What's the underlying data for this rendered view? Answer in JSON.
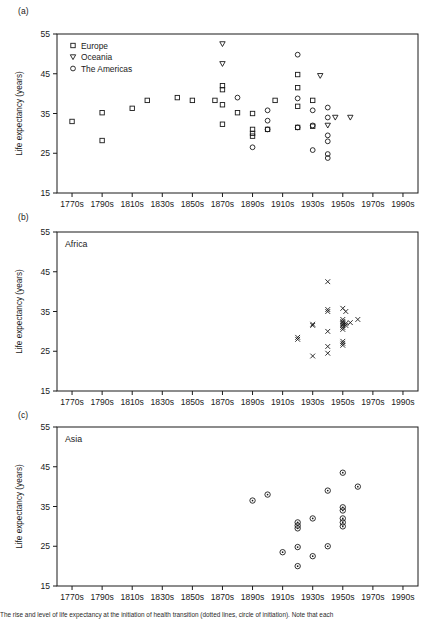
{
  "figure": {
    "caption": "The rise and level of life expectancy at the initiation of health transition (dotted lines, circle of initiation). Note that each",
    "y_axis_title": "Life expectancy (years)",
    "y_ticks": [
      15,
      25,
      35,
      45,
      55
    ],
    "x_ticks": [
      "1770s",
      "1790s",
      "1810s",
      "1830s",
      "1850s",
      "1870s",
      "1890s",
      "1910s",
      "1930s",
      "1950s",
      "1970s",
      "1990s"
    ]
  },
  "chart_data": [
    {
      "type": "scatter",
      "panel": "(a)",
      "title": "",
      "xlabel": "",
      "ylabel": "Life expectancy (years)",
      "xlim": [
        1760,
        2000
      ],
      "ylim": [
        15,
        55
      ],
      "x_tick_values": [
        1770,
        1790,
        1810,
        1830,
        1850,
        1870,
        1890,
        1910,
        1930,
        1950,
        1970,
        1990
      ],
      "x_tick_labels": [
        "1770s",
        "1790s",
        "1810s",
        "1830s",
        "1850s",
        "1870s",
        "1890s",
        "1910s",
        "1930s",
        "1950s",
        "1970s",
        "1990s"
      ],
      "y_tick_values": [
        15,
        25,
        35,
        45,
        55
      ],
      "grid": false,
      "legend_position": "top-left",
      "series": [
        {
          "name": "Europe",
          "marker": "square",
          "points": [
            [
              1770,
              33.0
            ],
            [
              1790,
              35.2
            ],
            [
              1790,
              28.2
            ],
            [
              1810,
              36.3
            ],
            [
              1820,
              38.3
            ],
            [
              1840,
              39.0
            ],
            [
              1850,
              38.3
            ],
            [
              1865,
              38.3
            ],
            [
              1870,
              42.0
            ],
            [
              1870,
              41.0
            ],
            [
              1870,
              37.2
            ],
            [
              1870,
              32.3
            ],
            [
              1880,
              35.2
            ],
            [
              1890,
              35.0
            ],
            [
              1890,
              31.0
            ],
            [
              1890,
              30.0
            ],
            [
              1890,
              29.3
            ],
            [
              1900,
              31.0
            ],
            [
              1905,
              38.3
            ],
            [
              1920,
              44.8
            ],
            [
              1920,
              41.5
            ],
            [
              1920,
              36.8
            ],
            [
              1920,
              31.5
            ],
            [
              1930,
              38.3
            ],
            [
              1930,
              31.8
            ]
          ]
        },
        {
          "name": "Oceania",
          "marker": "triangle-down",
          "points": [
            [
              1870,
              52.5
            ],
            [
              1870,
              47.5
            ],
            [
              1935,
              44.5
            ],
            [
              1940,
              32.0
            ],
            [
              1945,
              34.0
            ],
            [
              1955,
              34.0
            ]
          ]
        },
        {
          "name": "The Americas",
          "marker": "circle",
          "points": [
            [
              1880,
              39.0
            ],
            [
              1890,
              26.5
            ],
            [
              1900,
              35.8
            ],
            [
              1900,
              33.2
            ],
            [
              1900,
              31.0
            ],
            [
              1920,
              49.8
            ],
            [
              1920,
              38.8
            ],
            [
              1920,
              31.5
            ],
            [
              1930,
              35.8
            ],
            [
              1930,
              32.0
            ],
            [
              1930,
              25.8
            ],
            [
              1940,
              36.5
            ],
            [
              1940,
              34.0
            ],
            [
              1940,
              29.5
            ],
            [
              1940,
              28.0
            ],
            [
              1940,
              24.8
            ],
            [
              1940,
              23.8
            ]
          ]
        }
      ]
    },
    {
      "type": "scatter",
      "panel": "(b)",
      "title": "Africa",
      "xlabel": "",
      "ylabel": "Life expectancy (years)",
      "xlim": [
        1760,
        2000
      ],
      "ylim": [
        15,
        55
      ],
      "x_tick_values": [
        1770,
        1790,
        1810,
        1830,
        1850,
        1870,
        1890,
        1910,
        1930,
        1950,
        1970,
        1990
      ],
      "x_tick_labels": [
        "1770s",
        "1790s",
        "1810s",
        "1830s",
        "1850s",
        "1870s",
        "1890s",
        "1910s",
        "1930s",
        "1950s",
        "1970s",
        "1990s"
      ],
      "y_tick_values": [
        15,
        25,
        35,
        45,
        55
      ],
      "grid": false,
      "legend_position": "none",
      "series": [
        {
          "name": "Africa",
          "marker": "x",
          "points": [
            [
              1920,
              28.5
            ],
            [
              1920,
              28.0
            ],
            [
              1930,
              31.8
            ],
            [
              1930,
              31.5
            ],
            [
              1930,
              23.8
            ],
            [
              1940,
              42.5
            ],
            [
              1940,
              35.5
            ],
            [
              1940,
              35.0
            ],
            [
              1940,
              30.0
            ],
            [
              1940,
              26.2
            ],
            [
              1940,
              24.5
            ],
            [
              1950,
              35.8
            ],
            [
              1950,
              33.0
            ],
            [
              1950,
              32.5
            ],
            [
              1950,
              32.2
            ],
            [
              1950,
              31.8
            ],
            [
              1950,
              31.5
            ],
            [
              1950,
              31.0
            ],
            [
              1950,
              30.5
            ],
            [
              1950,
              27.5
            ],
            [
              1950,
              27.0
            ],
            [
              1950,
              26.5
            ],
            [
              1952,
              35.0
            ],
            [
              1952,
              32.0
            ],
            [
              1952,
              31.5
            ],
            [
              1955,
              32.2
            ],
            [
              1960,
              33.0
            ]
          ]
        }
      ]
    },
    {
      "type": "scatter",
      "panel": "(c)",
      "title": "Asia",
      "xlabel": "",
      "ylabel": "Life expectancy (years)",
      "xlim": [
        1760,
        2000
      ],
      "ylim": [
        15,
        55
      ],
      "x_tick_values": [
        1770,
        1790,
        1810,
        1830,
        1850,
        1870,
        1890,
        1910,
        1930,
        1950,
        1970,
        1990
      ],
      "x_tick_labels": [
        "1770s",
        "1790s",
        "1810s",
        "1830s",
        "1850s",
        "1870s",
        "1890s",
        "1910s",
        "1930s",
        "1950s",
        "1970s",
        "1990s"
      ],
      "y_tick_values": [
        15,
        25,
        35,
        45,
        55
      ],
      "grid": false,
      "legend_position": "none",
      "series": [
        {
          "name": "Asia",
          "marker": "circle-dot",
          "points": [
            [
              1890,
              36.5
            ],
            [
              1900,
              38.0
            ],
            [
              1910,
              23.5
            ],
            [
              1920,
              31.0
            ],
            [
              1920,
              30.2
            ],
            [
              1920,
              29.5
            ],
            [
              1920,
              24.8
            ],
            [
              1920,
              20.0
            ],
            [
              1930,
              32.0
            ],
            [
              1930,
              22.5
            ],
            [
              1940,
              39.0
            ],
            [
              1940,
              25.0
            ],
            [
              1950,
              43.5
            ],
            [
              1950,
              34.8
            ],
            [
              1950,
              34.0
            ],
            [
              1950,
              32.0
            ],
            [
              1950,
              31.0
            ],
            [
              1950,
              30.0
            ],
            [
              1960,
              40.0
            ]
          ]
        }
      ]
    }
  ],
  "legend": {
    "items": [
      {
        "label": "Europe",
        "marker": "square"
      },
      {
        "label": "Oceania",
        "marker": "triangle-down"
      },
      {
        "label": "The Americas",
        "marker": "circle"
      }
    ]
  },
  "panels": [
    {
      "tag": "(a)",
      "name": ""
    },
    {
      "tag": "(b)",
      "name": "Africa"
    },
    {
      "tag": "(c)",
      "name": "Asia"
    }
  ]
}
